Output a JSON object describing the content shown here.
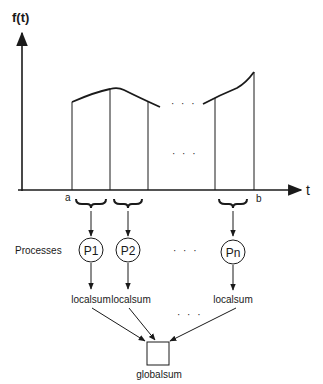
{
  "axes": {
    "y_label": "f(t)",
    "x_label": "t",
    "interval_start": "a",
    "interval_end": "b"
  },
  "ellipsis": "· · ·",
  "processes": {
    "row_label": "Processes",
    "nodes": [
      {
        "label": "P1",
        "output": "localsum"
      },
      {
        "label": "P2",
        "output": "localsum"
      },
      {
        "label": "Pn",
        "output": "localsum"
      }
    ]
  },
  "reduction": {
    "label": "globalsum"
  },
  "colors": {
    "stroke": "#1a1a1a",
    "background": "#ffffff"
  }
}
